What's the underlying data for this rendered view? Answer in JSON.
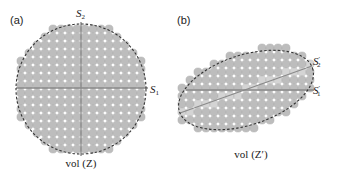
{
  "panels": [
    {
      "id": "a",
      "label": "(a)",
      "caption": "vol (Z)",
      "axis1": {
        "symbol": "S",
        "sub": "1",
        "prime": ""
      },
      "axis2": {
        "symbol": "S",
        "sub": "2",
        "prime": ""
      },
      "boundary": "dashed circle",
      "fill_color": "#bdbdbd",
      "grid_pitch_px": 8
    },
    {
      "id": "b",
      "label": "(b)",
      "caption": "vol (Z′)",
      "axis1": {
        "symbol": "S",
        "sub": "1",
        "prime": "′"
      },
      "axis2": {
        "symbol": "S",
        "sub": "2",
        "prime": "′"
      },
      "boundary": "dashed tilted ellipse",
      "fill_color": "#bdbdbd",
      "grid_pitch_px": 8
    }
  ],
  "colors": {
    "circle_fill": "#bdbdbd",
    "circle_highlight": "#d4d4d4",
    "axis_line": "#8a8a8a",
    "dashed_boundary": "#333333"
  }
}
